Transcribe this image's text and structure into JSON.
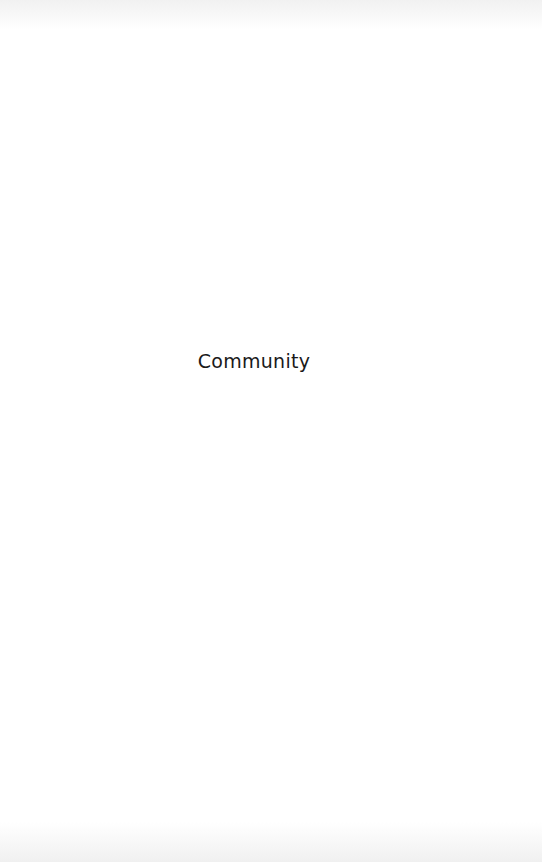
{
  "splash": {
    "title": "Community"
  },
  "colors": {
    "background": "#ffffff",
    "text": "#1a1a1a"
  }
}
